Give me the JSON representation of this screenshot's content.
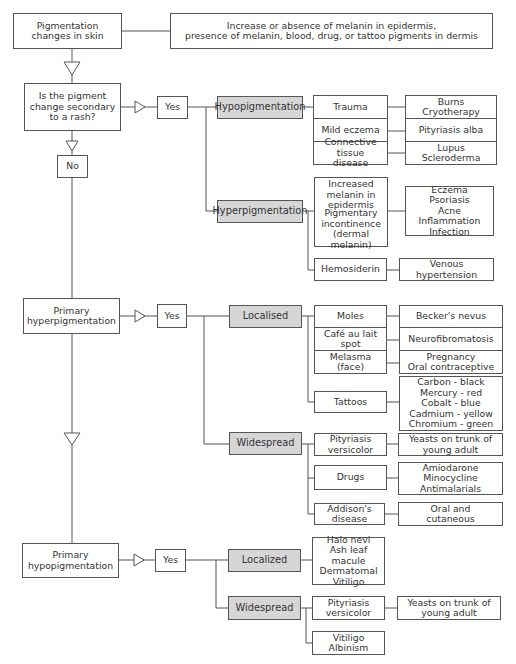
{
  "root": {
    "title": "Pigmentation\nchanges in skin",
    "description": "Increase or absence of melanin in epidermis,\npresence of melanin, blood, drug, or tattoo pigments in dermis"
  },
  "question": {
    "text": "Is the pigment\nchange secondary\nto a rash?",
    "yes": "Yes",
    "no": "No"
  },
  "rash": {
    "hypo": {
      "label": "Hypopigmentation",
      "causes": [
        {
          "cause": "Trauma",
          "examples": "Burns\nCryotherapy"
        },
        {
          "cause": "Mild eczema",
          "examples": "Pityriasis alba"
        },
        {
          "cause": "Connective tissue\ndisease",
          "examples": "Lupus\nScleroderma"
        }
      ]
    },
    "hyper": {
      "label": "Hyperpigmentation",
      "causes": [
        {
          "cause": "Increased\nmelanin in\nepidermis"
        },
        {
          "cause": "Pigmentary\nincontinence\n(dermal melanin)"
        },
        {
          "cause": "Hemosiderin",
          "examples": "Venous\nhypertension"
        }
      ],
      "shared_examples": "Eczema\nPsoriasis\nAcne\nInflammation\nInfection"
    }
  },
  "primary_hyper": {
    "label": "Primary\nhyperpigmentation",
    "yes": "Yes",
    "localised": {
      "label": "Localised",
      "causes": [
        {
          "cause": "Moles",
          "examples": "Becker's nevus"
        },
        {
          "cause": "Café au lait spot",
          "examples": "Neurofibromatosis"
        },
        {
          "cause": "Melasma\n(face)",
          "examples": "Pregnancy\nOral contraceptive"
        },
        {
          "cause": "Tattoos",
          "examples": "Carbon - black\nMercury - red\nCobalt - blue\nCadmium - yellow\nChromium - green"
        }
      ]
    },
    "widespread": {
      "label": "Widespread",
      "causes": [
        {
          "cause": "Pityriasis\nversicolor",
          "examples": "Yeasts on trunk of\nyoung adult"
        },
        {
          "cause": "Drugs",
          "examples": "Amiodarone\nMinocycline\nAntimalarials"
        },
        {
          "cause": "Addison's disease",
          "examples": "Oral and\ncutaneous"
        }
      ]
    }
  },
  "primary_hypo": {
    "label": "Primary\nhypopigmentation",
    "yes": "Yes",
    "localized": {
      "label": "Localized",
      "examples": "Halo nevi\nAsh leaf macule\nDermatomal\nVitiligo"
    },
    "widespread": {
      "label": "Widespread",
      "causes": [
        {
          "cause": "Pityriasis\nversicolor",
          "examples": "Yeasts on trunk of\nyoung adult"
        },
        {
          "cause": "Vitiligo\nAlbinism"
        }
      ]
    }
  },
  "colors": {
    "line": "#555555",
    "category_fill": "#d6d6d6",
    "box_fill": "#ffffff"
  }
}
